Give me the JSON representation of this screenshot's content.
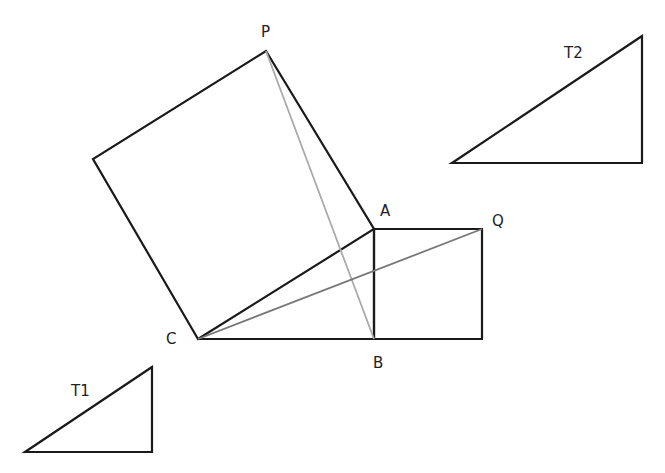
{
  "diagram": {
    "labels": {
      "P": "P",
      "A": "A",
      "Q": "Q",
      "C": "C",
      "B": "B",
      "T1": "T1",
      "T2": "T2"
    },
    "points": {
      "P": [
        266,
        51
      ],
      "A": [
        374,
        229
      ],
      "B": [
        374,
        339
      ],
      "C": [
        198,
        339
      ],
      "Q": [
        482,
        229
      ],
      "R": [
        482,
        339
      ],
      "S": [
        93,
        159
      ]
    },
    "colors": {
      "stroke": "#1a1a1a",
      "diag_light": "#aaaaaa",
      "diag_dark": "#777777"
    },
    "shapes": {
      "square_on_CA": "C-A-P-S",
      "rectangle_on_AB": "A-Q-R-B",
      "triangle_ABC": "A-B-C",
      "segment_PB": "P-B",
      "segment_CQ": "C-Q",
      "triangle_T1": [
        [
          152,
          367
        ],
        [
          25,
          452
        ],
        [
          152,
          452
        ]
      ],
      "triangle_T2": [
        [
          642,
          36
        ],
        [
          452,
          163
        ],
        [
          642,
          163
        ]
      ]
    }
  }
}
